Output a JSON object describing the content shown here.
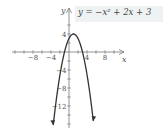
{
  "chart_data": {
    "type": "line",
    "title": "",
    "equation_label": "y = −x² + 2x + 3",
    "xlabel": "x",
    "ylabel": "y",
    "x_ticks": [
      -8,
      -4,
      4,
      8
    ],
    "y_ticks": [
      4,
      -4,
      -8,
      -12
    ],
    "x_tick_labels": [
      "−8",
      "−4",
      "4",
      "8"
    ],
    "y_tick_labels": [
      "4",
      "−4",
      "−8",
      "−12"
    ],
    "xlim": [
      -12,
      10
    ],
    "ylim": [
      -17,
      7
    ],
    "grid": false,
    "minor_tick_step": 2,
    "series": [
      {
        "name": "y = -x^2 + 2x + 3",
        "function": "-x^2 + 2x + 3",
        "vertex": [
          1,
          4
        ],
        "x_intercepts": [
          -1,
          3
        ],
        "y_intercept": 3,
        "x": [
          -3.5,
          -3,
          -2,
          -1,
          0,
          1,
          2,
          3,
          4,
          5,
          5.4
        ],
        "y": [
          -16.25,
          -12,
          -5,
          0,
          3,
          4,
          3,
          0,
          -5,
          -12,
          -15.56
        ]
      }
    ],
    "colors": {
      "curve": "#333333",
      "axes": "#777777",
      "label_bg": "#eef2f2"
    }
  }
}
